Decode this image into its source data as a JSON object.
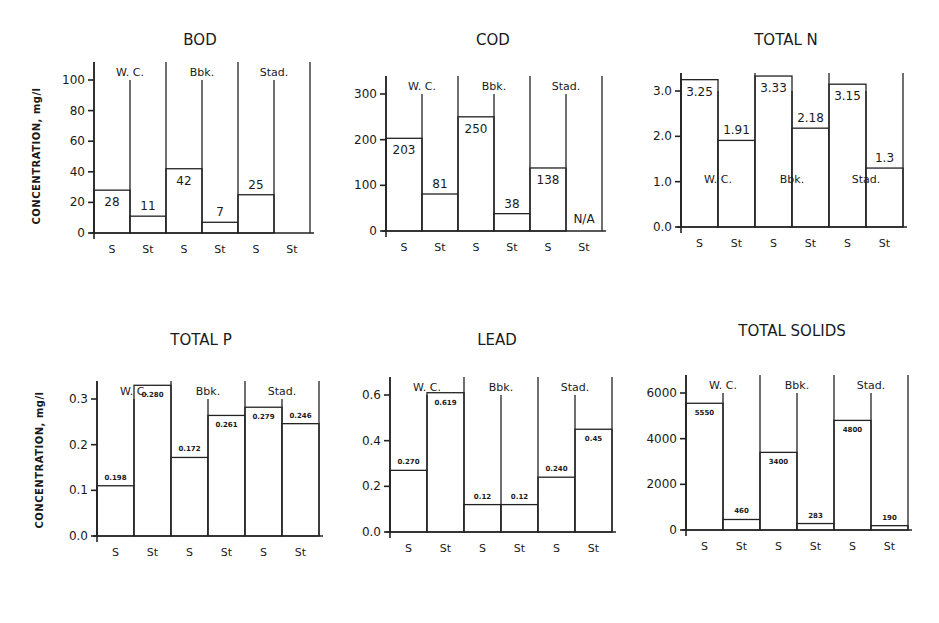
{
  "figure": {
    "y_axis_label": "CONCENTRATION, mg/l",
    "site_labels": [
      "W. C.",
      "Bbk.",
      "Stad."
    ],
    "bar_labels": [
      "S",
      "St",
      "S",
      "St",
      "S",
      "St"
    ]
  },
  "chart_data": [
    {
      "type": "bar",
      "title": "BOD",
      "ylabel": "CONCENTRATION, mg/l",
      "xlabel": "",
      "ylim": [
        0,
        100
      ],
      "yticks": [
        0,
        20,
        40,
        60,
        80,
        100
      ],
      "ytick_labels": [
        "0",
        "20",
        "40",
        "60",
        "80",
        "100"
      ],
      "groups": [
        "W. C.",
        "Bbk.",
        "Stad."
      ],
      "categories": [
        "S",
        "St",
        "S",
        "St",
        "S",
        "St"
      ],
      "values": [
        28,
        11,
        42,
        7,
        25,
        null
      ],
      "value_labels": [
        "28",
        "11",
        "42",
        "7",
        "25",
        ""
      ],
      "site_label_position": "top",
      "grid": false
    },
    {
      "type": "bar",
      "title": "COD",
      "ylabel": "",
      "xlabel": "",
      "ylim": [
        0,
        300
      ],
      "yticks": [
        0,
        100,
        200,
        300
      ],
      "ytick_labels": [
        "0",
        "100",
        "200",
        "300"
      ],
      "groups": [
        "W. C.",
        "Bbk.",
        "Stad."
      ],
      "categories": [
        "S",
        "St",
        "S",
        "St",
        "S",
        "St"
      ],
      "values": [
        203,
        81,
        250,
        38,
        138,
        null
      ],
      "value_labels": [
        "203",
        "81",
        "250",
        "38",
        "138",
        "N/A"
      ],
      "site_label_position": "top",
      "grid": false
    },
    {
      "type": "bar",
      "title": "TOTAL N",
      "ylabel": "",
      "xlabel": "",
      "ylim": [
        0,
        3.0
      ],
      "yticks": [
        0,
        1,
        2,
        3
      ],
      "ytick_labels": [
        "0.0",
        "1.0",
        "2.0",
        "3.0"
      ],
      "groups": [
        "W. C.",
        "Bbk.",
        "Stad."
      ],
      "categories": [
        "S",
        "St",
        "S",
        "St",
        "S",
        "St"
      ],
      "values": [
        3.25,
        1.91,
        3.33,
        2.18,
        3.15,
        1.3
      ],
      "value_labels": [
        "3.25",
        "1.91",
        "3.33",
        "2.18",
        "3.15",
        "1.3"
      ],
      "site_label_position": "inside",
      "grid": false
    },
    {
      "type": "bar",
      "title": "TOTAL P",
      "ylabel": "CONCENTRATION, mg/l",
      "xlabel": "",
      "ylim": [
        0,
        0.3
      ],
      "yticks": [
        0,
        0.1,
        0.2,
        0.3
      ],
      "ytick_labels": [
        "0.0",
        "0.1",
        "0.2",
        "0.3"
      ],
      "groups": [
        "W. C.",
        "Bbk.",
        "Stad."
      ],
      "categories": [
        "S",
        "St",
        "S",
        "St",
        "S",
        "St"
      ],
      "values": [
        0.11,
        0.33,
        0.172,
        0.264,
        0.282,
        0.246
      ],
      "value_labels": [
        "0.198",
        "0.280",
        "0.172",
        "0.261",
        "0.279",
        "0.246"
      ],
      "site_label_position": "top",
      "grid": false
    },
    {
      "type": "bar",
      "title": "LEAD",
      "ylabel": "",
      "xlabel": "",
      "ylim": [
        0,
        0.6
      ],
      "yticks": [
        0,
        0.2,
        0.4,
        0.6
      ],
      "ytick_labels": [
        "0.0",
        "0.2",
        "0.4",
        "0.6"
      ],
      "groups": [
        "W. C.",
        "Bbk.",
        "Stad."
      ],
      "categories": [
        "S",
        "St",
        "S",
        "St",
        "S",
        "St"
      ],
      "values": [
        0.27,
        0.61,
        0.12,
        0.12,
        0.24,
        0.45
      ],
      "value_labels": [
        "0.270",
        "0.619",
        "0.12",
        "0.12",
        "0.240",
        "0.45"
      ],
      "site_label_position": "top",
      "grid": false
    },
    {
      "type": "bar",
      "title": "TOTAL SOLIDS",
      "ylabel": "",
      "xlabel": "",
      "ylim": [
        0,
        6000
      ],
      "yticks": [
        0,
        2000,
        4000,
        6000
      ],
      "ytick_labels": [
        "0",
        "2000",
        "4000",
        "6000"
      ],
      "groups": [
        "W. C.",
        "Bbk.",
        "Stad."
      ],
      "categories": [
        "S",
        "St",
        "S",
        "St",
        "S",
        "St"
      ],
      "values": [
        5550,
        460,
        3400,
        283,
        4800,
        190
      ],
      "value_labels": [
        "5550",
        "460",
        "3400",
        "283",
        "4800",
        "190"
      ],
      "site_label_position": "top",
      "grid": false
    }
  ],
  "layout": {
    "panels": [
      {
        "x0": 94,
        "yTop": 80,
        "y0": 233,
        "topTick": 100,
        "bw": 36,
        "title_x": 200,
        "title_y": 45,
        "small": false,
        "ylab_x": 40,
        "ylab_y": 156
      },
      {
        "x0": 386,
        "yTop": 94,
        "y0": 231,
        "topTick": 300,
        "bw": 36,
        "title_x": 493,
        "title_y": 45,
        "small": false
      },
      {
        "x0": 681,
        "yTop": 91,
        "y0": 227,
        "topTick": 3.0,
        "bw": 37,
        "title_x": 786,
        "title_y": 45,
        "small": false
      },
      {
        "x0": 97,
        "yTop": 399,
        "y0": 536,
        "topTick": 0.3,
        "bw": 37,
        "title_x": 201,
        "title_y": 345,
        "small": true,
        "ylab_x": 43,
        "ylab_y": 460
      },
      {
        "x0": 390,
        "yTop": 395,
        "y0": 532,
        "topTick": 0.6,
        "bw": 37,
        "title_x": 497,
        "title_y": 345,
        "small": true
      },
      {
        "x0": 686,
        "yTop": 393,
        "y0": 530,
        "topTick": 6000,
        "bw": 37,
        "title_x": 792,
        "title_y": 336,
        "small": true
      }
    ]
  }
}
